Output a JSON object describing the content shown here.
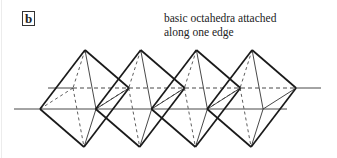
{
  "figure": {
    "panel_label": "b",
    "caption_lines": [
      "basic octahedra attached",
      "along one edge"
    ]
  },
  "diagram": {
    "octahedra_count": 4,
    "spacing_px": 55.7,
    "base_vertices": {
      "top": [
        85,
        50
      ],
      "bottom": [
        84,
        147
      ],
      "left": [
        40,
        109
      ],
      "front": [
        96,
        109
      ],
      "back": [
        73,
        88
      ],
      "right": [
        129,
        88
      ]
    },
    "front_axis": {
      "x1": 14,
      "x2": 287,
      "y": 109
    },
    "back_axis": {
      "x1": 48,
      "x_dash_start": 73,
      "x_dash_end": 295,
      "x2": 321,
      "y": 88
    },
    "colors": {
      "stroke": "#1a1a1a",
      "thin": "#333333"
    }
  }
}
